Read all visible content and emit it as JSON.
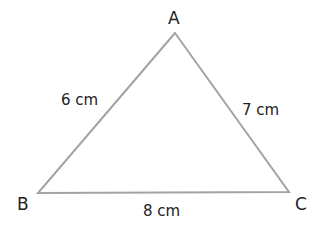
{
  "diagram": {
    "type": "triangle",
    "line_color": "#a3a3a3",
    "text_color": "#222222",
    "vertices": [
      {
        "name": "A",
        "x": 175,
        "y": 33
      },
      {
        "name": "B",
        "x": 38,
        "y": 193
      },
      {
        "name": "C",
        "x": 289,
        "y": 192
      }
    ],
    "sides": [
      {
        "between": "AB",
        "label": "6 cm"
      },
      {
        "between": "AC",
        "label": "7 cm"
      },
      {
        "between": "BC",
        "label": "8 cm"
      }
    ]
  }
}
